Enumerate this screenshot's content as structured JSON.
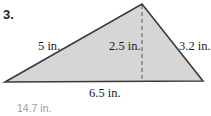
{
  "problem": {
    "number": "3.",
    "answer": "14.7 in."
  },
  "figure": {
    "type": "triangle",
    "vertices": {
      "left": [
        5,
        82
      ],
      "apex": [
        142,
        4
      ],
      "right": [
        203,
        81
      ]
    },
    "altitude_x": 142,
    "fill_color": "#d6d6d6",
    "stroke_color": "#3a3a3a",
    "labels": {
      "left_side": "5 in.",
      "height": "2.5 in.",
      "right_side": "3.2 in.",
      "base": "6.5 in."
    }
  }
}
